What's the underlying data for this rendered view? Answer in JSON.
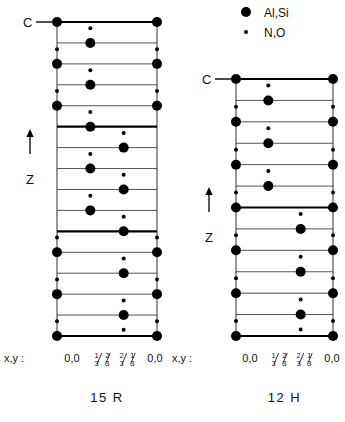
{
  "figure": {
    "title_hidden": "",
    "legend": {
      "items": [
        {
          "symbol": "large-filled-circle",
          "label": "Al,Si",
          "radius": 5.0
        },
        {
          "symbol": "small-filled-circle",
          "label": "N,O",
          "radius": 2.0
        }
      ],
      "x": 246,
      "y": 12
    },
    "colors": {
      "ink": "#000000",
      "background": "#ffffff",
      "thin_line": "#1a1a1a",
      "thick_line": "#000000"
    },
    "axis_label": {
      "text": "Z",
      "arrow": "up-arrow"
    },
    "c_label": {
      "text": "C",
      "dash": "—"
    },
    "xy_label": {
      "text": "x,y :"
    },
    "coord_labels": [
      {
        "kind": "plain",
        "text": "0,0"
      },
      {
        "kind": "fraction",
        "num": "1 2",
        "den": "3 3",
        "text": "1/3 2/3"
      },
      {
        "kind": "fraction",
        "num": "2 1",
        "den": "3 3",
        "text": "2/3 1/3"
      },
      {
        "kind": "plain",
        "text": "0,0"
      }
    ],
    "panels": [
      {
        "id": "15R",
        "caption": "15 R",
        "frame": {
          "x0": 57,
          "x1": 157,
          "y0": 22,
          "y1": 336
        },
        "rows": 15,
        "unit_boundary_rows": [
          0,
          5,
          10,
          15
        ],
        "columns": [
          0,
          0.3333,
          0.6667,
          1
        ],
        "c_label_row": 0,
        "z_arrow": {
          "x": 30,
          "y_top": 128,
          "y_bot": 170
        },
        "large_atoms": [
          {
            "row": 0,
            "cols": [
              0,
              1
            ]
          },
          {
            "row": 1,
            "cols": [
              0.3333
            ]
          },
          {
            "row": 2,
            "cols": [
              0,
              1
            ]
          },
          {
            "row": 3,
            "cols": [
              0.3333
            ]
          },
          {
            "row": 4,
            "cols": [
              0,
              1
            ]
          },
          {
            "row": 5,
            "cols": [
              0.3333
            ]
          },
          {
            "row": 6,
            "cols": [
              0.6667
            ]
          },
          {
            "row": 7,
            "cols": [
              0.3333
            ]
          },
          {
            "row": 8,
            "cols": [
              0.6667
            ]
          },
          {
            "row": 9,
            "cols": [
              0.3333
            ]
          },
          {
            "row": 10,
            "cols": [
              0.6667
            ]
          },
          {
            "row": 11,
            "cols": [
              0,
              1
            ]
          },
          {
            "row": 12,
            "cols": [
              0.6667
            ]
          },
          {
            "row": 13,
            "cols": [
              0,
              1
            ]
          },
          {
            "row": 14,
            "cols": [
              0.6667
            ]
          },
          {
            "row": 15,
            "cols": [
              0,
              1
            ]
          }
        ],
        "small_atoms": [
          {
            "row": 0,
            "offset": 0.3,
            "cols": [
              0.3333
            ]
          },
          {
            "row": 1,
            "offset": 0.3,
            "cols": [
              0,
              1
            ]
          },
          {
            "row": 2,
            "offset": 0.3,
            "cols": [
              0.3333
            ]
          },
          {
            "row": 3,
            "offset": 0.3,
            "cols": [
              0,
              1
            ]
          },
          {
            "row": 4,
            "offset": 0.3,
            "cols": [
              0.3333
            ]
          },
          {
            "row": 5,
            "offset": 0.3,
            "cols": [
              0.6667
            ]
          },
          {
            "row": 6,
            "offset": 0.3,
            "cols": [
              0.3333
            ]
          },
          {
            "row": 7,
            "offset": 0.3,
            "cols": [
              0.6667
            ]
          },
          {
            "row": 8,
            "offset": 0.3,
            "cols": [
              0.3333
            ]
          },
          {
            "row": 9,
            "offset": 0.3,
            "cols": [
              0.6667
            ]
          },
          {
            "row": 10,
            "offset": 0.3,
            "cols": [
              0,
              1
            ]
          },
          {
            "row": 11,
            "offset": 0.3,
            "cols": [
              0.6667
            ]
          },
          {
            "row": 12,
            "offset": 0.3,
            "cols": [
              0,
              1
            ]
          },
          {
            "row": 13,
            "offset": 0.3,
            "cols": [
              0.6667
            ]
          },
          {
            "row": 14,
            "offset": 0.3,
            "cols": [
              0,
              1
            ]
          },
          {
            "row": 15,
            "offset": -0.3,
            "cols": [
              0.6667
            ]
          }
        ],
        "coord_x": [
          72,
          103,
          128,
          155
        ]
      },
      {
        "id": "12H",
        "caption": "12 H",
        "frame": {
          "x0": 236,
          "x1": 333,
          "y0": 79,
          "y1": 336
        },
        "rows": 12,
        "unit_boundary_rows": [
          0,
          6,
          12
        ],
        "columns": [
          0,
          0.3333,
          0.6667,
          1
        ],
        "c_label_row": 0,
        "z_arrow": {
          "x": 209,
          "y_top": 186,
          "y_bot": 228
        },
        "large_atoms": [
          {
            "row": 0,
            "cols": [
              0,
              1
            ]
          },
          {
            "row": 1,
            "cols": [
              0.3333
            ]
          },
          {
            "row": 2,
            "cols": [
              0,
              1
            ]
          },
          {
            "row": 3,
            "cols": [
              0.3333
            ]
          },
          {
            "row": 4,
            "cols": [
              0,
              1
            ]
          },
          {
            "row": 5,
            "cols": [
              0.3333
            ]
          },
          {
            "row": 6,
            "cols": [
              0,
              1
            ]
          },
          {
            "row": 7,
            "cols": [
              0.6667
            ]
          },
          {
            "row": 8,
            "cols": [
              0,
              1
            ]
          },
          {
            "row": 9,
            "cols": [
              0.6667
            ]
          },
          {
            "row": 10,
            "cols": [
              0,
              1
            ]
          },
          {
            "row": 11,
            "cols": [
              0.6667
            ]
          },
          {
            "row": 12,
            "cols": [
              0,
              1
            ]
          }
        ],
        "small_atoms": [
          {
            "row": 0,
            "offset": 0.3,
            "cols": [
              0.3333
            ]
          },
          {
            "row": 1,
            "offset": 0.3,
            "cols": [
              0,
              1
            ]
          },
          {
            "row": 2,
            "offset": 0.3,
            "cols": [
              0.3333
            ]
          },
          {
            "row": 3,
            "offset": 0.3,
            "cols": [
              0,
              1
            ]
          },
          {
            "row": 4,
            "offset": 0.3,
            "cols": [
              0.3333
            ]
          },
          {
            "row": 5,
            "offset": 0.3,
            "cols": [
              0,
              1
            ]
          },
          {
            "row": 6,
            "offset": 0.3,
            "cols": [
              0.6667
            ]
          },
          {
            "row": 7,
            "offset": 0.3,
            "cols": [
              0,
              1
            ]
          },
          {
            "row": 8,
            "offset": 0.3,
            "cols": [
              0.6667
            ]
          },
          {
            "row": 9,
            "offset": 0.3,
            "cols": [
              0,
              1
            ]
          },
          {
            "row": 10,
            "offset": 0.3,
            "cols": [
              0.6667
            ]
          },
          {
            "row": 11,
            "offset": 0.3,
            "cols": [
              0,
              1
            ]
          },
          {
            "row": 12,
            "offset": -0.3,
            "cols": [
              0.6667
            ]
          }
        ],
        "coord_x": [
          250,
          280,
          305,
          332
        ]
      }
    ],
    "xy_row_y": 362,
    "caption_y": 402,
    "xy_label_x": [
      4,
      172
    ]
  },
  "chart_data": {
    "type": "diagram",
    "panels": [
      "15 R",
      "12 H"
    ],
    "legend": [
      "Al,Si",
      "N,O"
    ],
    "xaxis_ticks": [
      "0,0",
      "1/3 2/3",
      "2/3 1/3",
      "0,0"
    ],
    "yaxis_label": "Z"
  }
}
